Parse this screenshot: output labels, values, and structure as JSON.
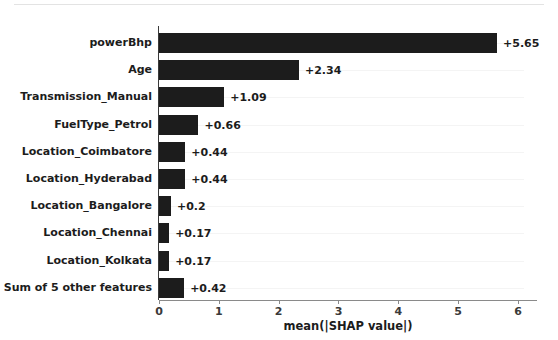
{
  "chart_data": {
    "type": "bar",
    "orientation": "horizontal",
    "title": "",
    "subtitle": "",
    "xlabel": "mean(|SHAP value|)",
    "ylabel": "",
    "xlim": [
      0,
      6.3
    ],
    "xticks": [
      "0",
      "1",
      "2",
      "3",
      "4",
      "5",
      "6"
    ],
    "xtick_values": [
      0,
      1,
      2,
      3,
      4,
      5,
      6
    ],
    "grid": true,
    "legend": null,
    "categories": [
      "powerBhp",
      "Age",
      "Transmission_Manual",
      "FuelType_Petrol",
      "Location_Coimbatore",
      "Location_Hyderabad",
      "Location_Bangalore",
      "Location_Chennai",
      "Location_Kolkata",
      "Sum of 5 other features"
    ],
    "values": [
      5.65,
      2.34,
      1.09,
      0.66,
      0.44,
      0.44,
      0.2,
      0.17,
      0.17,
      0.42
    ],
    "data_labels": [
      "+5.65",
      "+2.34",
      "+1.09",
      "+0.66",
      "+0.44",
      "+0.44",
      "+0.2",
      "+0.17",
      "+0.17",
      "+0.42"
    ],
    "bar_color": "#1c1c1c",
    "background_color": "#ffffff"
  }
}
